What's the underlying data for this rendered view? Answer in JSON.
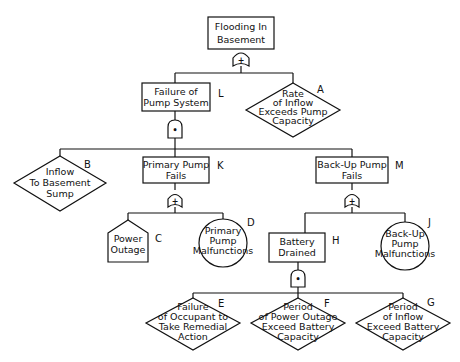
{
  "diagram": {
    "type": "fault-tree",
    "top_event": {
      "id": "top",
      "lines": [
        "Flooding In",
        "Basement"
      ],
      "gate": "OR",
      "gate_symbol": "+"
    },
    "nodes": {
      "L": {
        "letter": "L",
        "shape": "rectangle",
        "lines": [
          "Failure of",
          "Pump System"
        ],
        "gate": "AND",
        "gate_symbol": "•"
      },
      "A": {
        "letter": "A",
        "shape": "diamond",
        "lines": [
          "Rate",
          "of Inflow",
          "Exceeds Pump",
          "Capacity"
        ]
      },
      "B": {
        "letter": "B",
        "shape": "diamond",
        "lines": [
          "Inflow",
          "To Basement",
          "Sump"
        ]
      },
      "K": {
        "letter": "K",
        "shape": "rectangle",
        "lines": [
          "Primary Pump",
          "Fails"
        ],
        "gate": "OR",
        "gate_symbol": "+"
      },
      "M": {
        "letter": "M",
        "shape": "rectangle",
        "lines": [
          "Back-Up Pump",
          "Fails"
        ],
        "gate": "OR",
        "gate_symbol": "+"
      },
      "C": {
        "letter": "C",
        "shape": "house",
        "lines": [
          "Power",
          "Outage"
        ]
      },
      "D": {
        "letter": "D",
        "shape": "circle",
        "lines": [
          "Primary",
          "Pump",
          "Malfunctions"
        ]
      },
      "H": {
        "letter": "H",
        "shape": "rectangle",
        "lines": [
          "Battery",
          "Drained"
        ],
        "gate": "AND",
        "gate_symbol": "•"
      },
      "J": {
        "letter": "J",
        "shape": "circle",
        "lines": [
          "Back-Up",
          "Pump",
          "Malfunctions"
        ]
      },
      "E": {
        "letter": "E",
        "shape": "diamond",
        "lines": [
          "Failure",
          "of Occupant to",
          "Take Remedial",
          "Action"
        ]
      },
      "F": {
        "letter": "F",
        "shape": "diamond",
        "lines": [
          "Period",
          "of Power Outage",
          "Exceed Battery",
          "Capacity"
        ]
      },
      "G": {
        "letter": "G",
        "shape": "diamond",
        "lines": [
          "Period",
          "of Inflow",
          "Exceed Battery",
          "Capacity"
        ]
      }
    },
    "edges": [
      [
        "top",
        "L"
      ],
      [
        "top",
        "A"
      ],
      [
        "L",
        "B"
      ],
      [
        "L",
        "K"
      ],
      [
        "L",
        "M"
      ],
      [
        "K",
        "C"
      ],
      [
        "K",
        "D"
      ],
      [
        "M",
        "H"
      ],
      [
        "M",
        "J"
      ],
      [
        "H",
        "E"
      ],
      [
        "H",
        "F"
      ],
      [
        "H",
        "G"
      ]
    ]
  }
}
